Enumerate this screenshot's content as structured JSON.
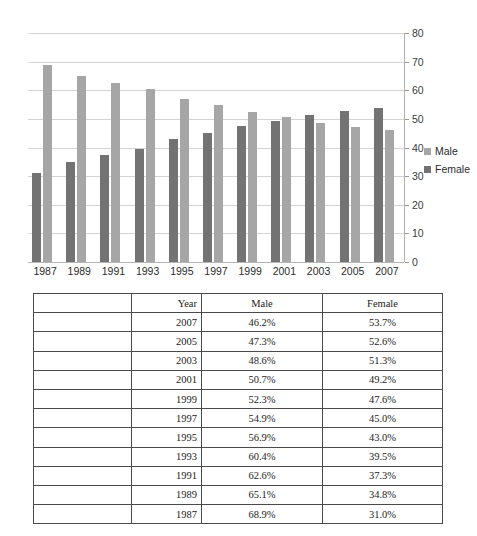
{
  "chart_data": {
    "type": "bar",
    "title": "",
    "subtitle": "",
    "xlabel": "",
    "ylabel": "",
    "ylim": [
      0,
      80
    ],
    "ytick_step": 10,
    "yticks": [
      80,
      70,
      60,
      50,
      40,
      30,
      20,
      10,
      0
    ],
    "grid": true,
    "grid_axis": "y",
    "legend_position": "right",
    "y_axis_side": "right",
    "bar_order_in_group": [
      "Female",
      "Male"
    ],
    "categories": [
      "1987",
      "1989",
      "1991",
      "1993",
      "1995",
      "1997",
      "1999",
      "2001",
      "2003",
      "2005",
      "2007"
    ],
    "series": [
      {
        "name": "Male",
        "color": "#a6a6a6",
        "values": [
          68.9,
          65.1,
          62.6,
          60.4,
          56.9,
          54.9,
          52.3,
          50.7,
          48.6,
          47.3,
          46.2
        ]
      },
      {
        "name": "Female",
        "color": "#737373",
        "values": [
          31.0,
          34.8,
          37.3,
          39.5,
          43.0,
          45.0,
          47.6,
          49.2,
          51.3,
          52.6,
          53.7
        ]
      }
    ]
  },
  "chart": {
    "legend": [
      {
        "label": "Male",
        "color": "#a6a6a6",
        "swatch": "legend-swatch-male"
      },
      {
        "label": "Female",
        "color": "#737373",
        "swatch": "legend-swatch-female"
      }
    ]
  },
  "table": {
    "columns": [
      "",
      "Year",
      "Male",
      "Female"
    ],
    "headers": {
      "blank": "",
      "year": "Year",
      "male": "Male",
      "female": "Female"
    },
    "rows": [
      {
        "blank": "",
        "year": "2007",
        "male": "46.2%",
        "female": "53.7%"
      },
      {
        "blank": "",
        "year": "2005",
        "male": "47.3%",
        "female": "52.6%"
      },
      {
        "blank": "",
        "year": "2003",
        "male": "48.6%",
        "female": "51.3%"
      },
      {
        "blank": "",
        "year": "2001",
        "male": "50.7%",
        "female": "49.2%"
      },
      {
        "blank": "",
        "year": "1999",
        "male": "52.3%",
        "female": "47.6%"
      },
      {
        "blank": "",
        "year": "1997",
        "male": "54.9%",
        "female": "45.0%"
      },
      {
        "blank": "",
        "year": "1995",
        "male": "56.9%",
        "female": "43.0%"
      },
      {
        "blank": "",
        "year": "1993",
        "male": "60.4%",
        "female": "39.5%"
      },
      {
        "blank": "",
        "year": "1991",
        "male": "62.6%",
        "female": "37.3%"
      },
      {
        "blank": "",
        "year": "1989",
        "male": "65.1%",
        "female": "34.8%"
      },
      {
        "blank": "",
        "year": "1987",
        "male": "68.9%",
        "female": "31.0%"
      }
    ]
  },
  "colors": {
    "male_bar": "#a6a6a6",
    "female_bar": "#737373",
    "gridline": "#d3d3d3",
    "axis": "#b0b0b0",
    "table_border": "#4a4a4a",
    "text": "#2b2b2b"
  }
}
